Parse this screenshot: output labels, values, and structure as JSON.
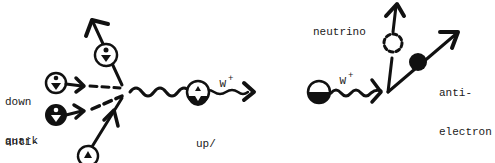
{
  "diagram": {
    "type": "particle-interaction-sketch",
    "ink_color": "#111111",
    "background": "#ffffff",
    "left_panel": {
      "labels": {
        "down_quark_line1": "down",
        "down_quark_line2": "quark",
        "anti_down_line1": "anti-",
        "anti_down_line2": "down",
        "w_boson": "W",
        "w_charge": "+",
        "product_line1": "up/",
        "product_line2": "anti-down"
      }
    },
    "right_panel": {
      "labels": {
        "w_boson": "W",
        "w_charge": "+",
        "neutrino": "neutrino",
        "anti_electron_line1": "anti-",
        "anti_electron_line2": "electron"
      }
    }
  }
}
